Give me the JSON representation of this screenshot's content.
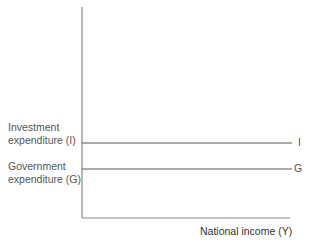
{
  "diagram": {
    "x_axis_label": "National income (Y)",
    "y_labels": {
      "investment": [
        "Investment",
        "expenditure (I)"
      ],
      "government": [
        "Government",
        "expenditure (G)"
      ]
    },
    "line_labels": {
      "investment": "I",
      "government": "G"
    },
    "colors": {
      "axis": "#777777",
      "line": "#555555",
      "text": "#555555"
    }
  }
}
